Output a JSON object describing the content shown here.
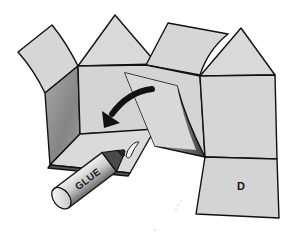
{
  "figure": {
    "panel_label": "D",
    "glue_label": "GLUE",
    "colors": {
      "panel_fill": "#d6d6d6",
      "panel_light": "#dedede",
      "shadow_dark": "#6e6e6e",
      "outline": "#111111",
      "arrow": "#111111",
      "background": "#ffffff"
    }
  }
}
